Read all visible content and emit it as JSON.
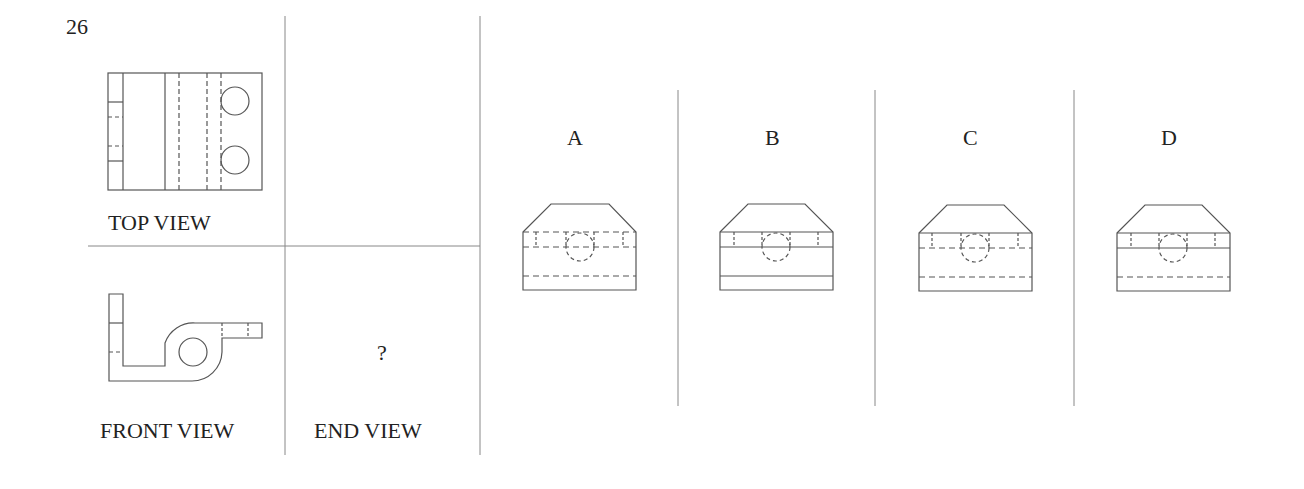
{
  "question": {
    "number": "26",
    "given_views": {
      "top_view_label": "TOP VIEW",
      "front_view_label": "FRONT VIEW",
      "end_view_label": "END VIEW",
      "end_view_placeholder": "?"
    },
    "options": [
      {
        "label": "A",
        "variant": "upper-band-hidden-lines, bottom-hidden-line"
      },
      {
        "label": "B",
        "variant": "upper-band-solid-lines, bottom-solid-line"
      },
      {
        "label": "C",
        "variant": "upper-band-top-solid, mid-hidden, bottom-hidden"
      },
      {
        "label": "D",
        "variant": "upper-band-solid-lines, bottom-hidden-line"
      }
    ]
  },
  "colors": {
    "line": "#555555",
    "text": "#222222",
    "background": "#ffffff"
  }
}
